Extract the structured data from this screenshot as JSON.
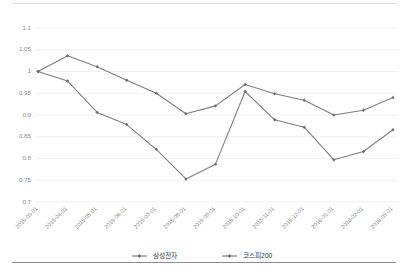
{
  "chart_data": {
    "type": "line",
    "title": "",
    "xlabel": "",
    "ylabel": "",
    "ylim": [
      0.7,
      1.1
    ],
    "yticks": [
      "1.1",
      "1.05",
      "1",
      "0.95",
      "0.9",
      "0.85",
      "0.8",
      "0.75",
      "0.7"
    ],
    "ytick_values": [
      1.1,
      1.05,
      1.0,
      0.95,
      0.9,
      0.85,
      0.8,
      0.75,
      0.7
    ],
    "grid": true,
    "legend_position": "bottom",
    "categories": [
      "2015-03-01",
      "2015-04-01",
      "2015-05-01",
      "2015-06-01",
      "2015-07-01",
      "2015-08-01",
      "2015-09-01",
      "2015-10-01",
      "2015-11-01",
      "2015-12-01",
      "2016-01-01",
      "2016-02-01",
      "2016-03-01"
    ],
    "series": [
      {
        "name": "삼성전자",
        "color": "#7f7f7f",
        "values": [
          1.0,
          1.036,
          1.011,
          0.98,
          0.95,
          0.903,
          0.921,
          0.97,
          0.949,
          0.934,
          0.9,
          0.911,
          0.94
        ]
      },
      {
        "name": "코스피200",
        "color": "#7f7f7f",
        "values": [
          1.0,
          0.978,
          0.906,
          0.878,
          0.821,
          0.753,
          0.787,
          0.954,
          0.889,
          0.872,
          0.797,
          0.816,
          0.866
        ]
      }
    ]
  },
  "legend": {
    "items": [
      {
        "label": "삼성전자"
      },
      {
        "label": "코스피200"
      }
    ]
  }
}
